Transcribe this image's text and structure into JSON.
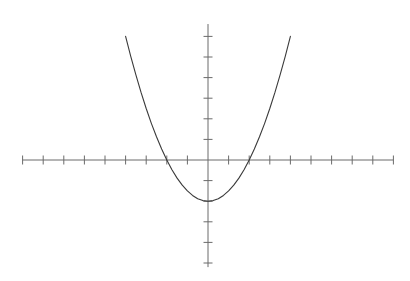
{
  "figure": {
    "width": 410,
    "height": 281,
    "background": "#ffffff",
    "axis_color": "#6b6b6b",
    "curve_color": "#3a3a3a",
    "tick_color": "#6b6b6b"
  },
  "chart_data": {
    "type": "line",
    "title": "",
    "subtitle": "",
    "xlabel": "",
    "ylabel": "",
    "legend": [],
    "annotations": [],
    "grid": false,
    "legend_position": "none",
    "axes_style": "centered-cartesian",
    "origin_px": {
      "x": 208,
      "y": 160
    },
    "unit_px": {
      "x": 20.6,
      "y": 20.6
    },
    "xlim": [
      -9,
      9
    ],
    "ylim": [
      -5.2,
      6.6
    ],
    "x_ticks": [
      -9,
      -8,
      -7,
      -6,
      -5,
      -4,
      -3,
      -2,
      -1,
      1,
      2,
      3,
      4,
      5,
      6,
      7,
      8,
      9
    ],
    "y_ticks": [
      -5,
      -4,
      -3,
      -2,
      -1,
      1,
      2,
      3,
      4,
      5,
      6
    ],
    "tick_labels_visible": false,
    "series": [
      {
        "name": "parabola",
        "equation": "y = 0.5x^2 - 2",
        "color": "#3a3a3a",
        "line_width": 1.1,
        "domain": [
          -4.0,
          4.0
        ],
        "x": [
          -4.0,
          -3.75,
          -3.5,
          -3.25,
          -3.0,
          -2.75,
          -2.5,
          -2.25,
          -2.0,
          -1.75,
          -1.5,
          -1.25,
          -1.0,
          -0.75,
          -0.5,
          -0.25,
          0.0,
          0.25,
          0.5,
          0.75,
          1.0,
          1.25,
          1.5,
          1.75,
          2.0,
          2.25,
          2.5,
          2.75,
          3.0,
          3.25,
          3.5,
          3.75,
          4.0
        ],
        "y": [
          6.0,
          5.03,
          4.13,
          3.28,
          2.5,
          1.78,
          1.13,
          0.53,
          0.0,
          -0.47,
          -0.88,
          -1.22,
          -1.5,
          -1.72,
          -1.88,
          -1.97,
          -2.0,
          -1.97,
          -1.88,
          -1.72,
          -1.5,
          -1.22,
          -0.88,
          -0.47,
          0.0,
          0.53,
          1.13,
          1.78,
          2.5,
          3.28,
          4.13,
          5.03,
          6.0
        ]
      }
    ],
    "key_points": {
      "vertex": [
        0,
        -2
      ],
      "x_intercepts": [
        -2,
        2
      ],
      "y_intercept": -2
    }
  }
}
